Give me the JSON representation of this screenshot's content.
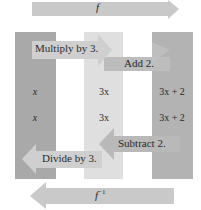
{
  "top_arrow": {
    "label": "f",
    "direction": "right",
    "color": "#c6c6c6"
  },
  "bottom_arrow": {
    "label": "f⁻¹",
    "label_base": "f",
    "label_sup": "−1",
    "direction": "left",
    "color": "#c6c6c6"
  },
  "columns": [
    {
      "name": "input",
      "color": "#a9a9a9",
      "values": [
        "x",
        "x"
      ]
    },
    {
      "name": "intermediate",
      "color": "#dfdfdf",
      "values": [
        "3x",
        "3x"
      ]
    },
    {
      "name": "output",
      "color": "#b3b3b3",
      "values": [
        "3x + 2",
        "3x + 2"
      ]
    }
  ],
  "steps": {
    "forward": [
      {
        "label": "Multiply by 3.",
        "direction": "right"
      },
      {
        "label": "Add 2.",
        "direction": "right"
      }
    ],
    "inverse": [
      {
        "label": "Subtract 2.",
        "direction": "left"
      },
      {
        "label": "Divide by 3.",
        "direction": "left"
      }
    ]
  },
  "colors": {
    "arrow_light": "#c9c9c9",
    "arrow_mid": "#b9b9b9",
    "label_bg": "#d4d4d4",
    "text": "#2a2a2a"
  }
}
